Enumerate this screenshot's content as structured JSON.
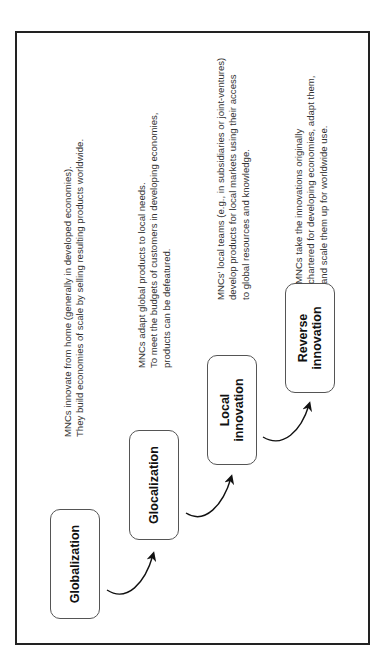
{
  "diagram": {
    "stages": [
      {
        "label": "Globalization",
        "description": "MNCs innovate from home (generally in developed economies).\nThey build economies of scale by selling resulting products worldwide."
      },
      {
        "label": "Glocalization",
        "description": "MNCs adapt global products to local needs.\nTo meet the budgets of customers in developing economies,\nproducts can be defeatured."
      },
      {
        "label": "Local\ninnovation",
        "description": "MNCs' local teams (e.g., in subsidiaries or joint-ventures)\ndevelop products for local markets using their access\nto global resources and knowledge."
      },
      {
        "label": "Reverse\ninnovation",
        "description": "MNCs take the innovations originally\nchartered for developing economies, adapt them,\nand scale them up for worldwide use."
      }
    ],
    "arrows": [
      "globalization-to-glocalization",
      "glocalization-to-local-innovation",
      "local-innovation-to-reverse-innovation"
    ],
    "colors": {
      "border": "#222222",
      "box_border": "#555555",
      "text": "#333333"
    }
  }
}
